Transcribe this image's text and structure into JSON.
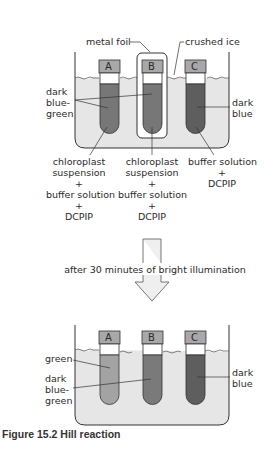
{
  "figure": {
    "caption": "Figure 15.2  Hill reaction"
  },
  "top_setup": {
    "labels": {
      "metal_foil": "metal foil",
      "crushed_ice": "crushed ice",
      "left_color": [
        "dark",
        "blue-",
        "green"
      ],
      "right_color": [
        "dark",
        "blue"
      ]
    },
    "tubes": [
      {
        "id": "A",
        "contents": [
          "chloroplast",
          "suspension",
          "+",
          "buffer solution",
          "+",
          "DCPIP"
        ],
        "color": "#777777"
      },
      {
        "id": "B",
        "contents": [
          "chloroplast",
          "suspension",
          "+",
          "buffer solution",
          "+",
          "DCPIP"
        ],
        "color": "#777777"
      },
      {
        "id": "C",
        "contents": [
          "buffer solution",
          "+",
          "DCPIP"
        ],
        "color": "#5e5e5e"
      }
    ]
  },
  "transition": {
    "text": "after 30 minutes of bright illumination"
  },
  "bottom_setup": {
    "labels": {
      "green": "green",
      "dark_blue_green": [
        "dark",
        "blue-",
        "green"
      ],
      "dark_blue": [
        "dark",
        "blue"
      ]
    },
    "tubes": [
      {
        "id": "A",
        "color": "#a3a3a3"
      },
      {
        "id": "B",
        "color": "#7a7a7a"
      },
      {
        "id": "C",
        "color": "#5e5e5e"
      }
    ]
  },
  "colors": {
    "ice": "#e6e6e6",
    "cap": "#a8a8a8",
    "outline": "#333333",
    "arrow_fill": "#efefef"
  }
}
